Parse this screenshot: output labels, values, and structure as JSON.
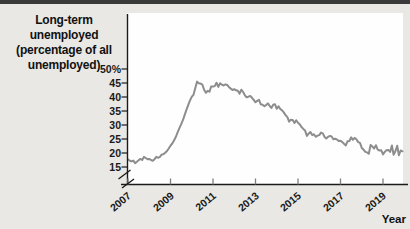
{
  "figure": {
    "title_lines": [
      "Long-term unemployed",
      "(percentage of all",
      "unemployed)"
    ],
    "x_axis_label": "Year"
  },
  "chart": {
    "y_ticks": [
      {
        "label": "50%",
        "value": 50
      },
      {
        "label": "45",
        "value": 45
      },
      {
        "label": "40",
        "value": 40
      },
      {
        "label": "35",
        "value": 35
      },
      {
        "label": "30",
        "value": 30
      },
      {
        "label": "25",
        "value": 25
      },
      {
        "label": "20",
        "value": 20
      },
      {
        "label": "15",
        "value": 15
      }
    ],
    "x_ticks": [
      {
        "label": "2007",
        "value": 2007
      },
      {
        "label": "2009",
        "value": 2009
      },
      {
        "label": "2011",
        "value": 2011
      },
      {
        "label": "2013",
        "value": 2013
      },
      {
        "label": "2015",
        "value": 2015
      },
      {
        "label": "2017",
        "value": 2017
      },
      {
        "label": "2019",
        "value": 2019
      }
    ]
  },
  "colors": {
    "page_background": "#e9e8e4",
    "plot_background": "#fefefe",
    "top_rule": "#3a3a3a",
    "axis": "#1a1a1a",
    "x_tick": "#7f7f7f",
    "data_line": "#8d8d8d",
    "text": "#111111"
  },
  "chart_data": {
    "type": "line",
    "title": "Long-term unemployed (percentage of all unemployed)",
    "xlabel": "Year",
    "ylabel": "Long-term unemployed (percentage of all unemployed)",
    "x_start_year": 2007,
    "x_end_year": 2019,
    "x_interval": "monthly",
    "x_tick_years": [
      2007,
      2009,
      2011,
      2013,
      2015,
      2017,
      2019
    ],
    "y_tick_values": [
      15,
      20,
      25,
      30,
      35,
      40,
      45,
      50
    ],
    "ylim_shown": [
      15,
      50
    ],
    "axis_break_at_origin": true,
    "grid": false,
    "legend": false,
    "series": [
      {
        "name": "Long-term unemployed (percentage of all unemployed)",
        "values": [
          17.7,
          17.2,
          17.0,
          17.3,
          16.4,
          16.9,
          17.4,
          17.9,
          17.5,
          18.6,
          18.2,
          17.8,
          17.9,
          17.5,
          17.2,
          17.8,
          18.6,
          18.3,
          18.6,
          19.4,
          19.6,
          20.1,
          20.7,
          21.6,
          22.6,
          23.4,
          24.5,
          25.7,
          27.4,
          28.9,
          30.2,
          31.7,
          33.6,
          35.4,
          37.1,
          38.8,
          40.1,
          40.8,
          43.2,
          45.5,
          44.9,
          44.8,
          44.4,
          42.6,
          41.5,
          42.2,
          41.9,
          43.8,
          43.7,
          43.9,
          45.1,
          43.6,
          44.9,
          44.4,
          44.1,
          44.5,
          44.3,
          43.6,
          43.0,
          42.5,
          42.8,
          42.4,
          42.2,
          41.2,
          42.6,
          41.8,
          40.6,
          39.9,
          40.1,
          40.4,
          39.7,
          39.0,
          38.1,
          38.6,
          39.0,
          37.4,
          37.2,
          36.7,
          37.1,
          37.7,
          36.8,
          36.1,
          37.2,
          37.4,
          35.8,
          36.7,
          35.7,
          35.2,
          34.5,
          33.5,
          32.8,
          31.2,
          31.9,
          31.8,
          30.7,
          31.7,
          30.8,
          30.2,
          29.3,
          28.6,
          28.0,
          26.1,
          26.9,
          27.5,
          26.4,
          26.7,
          25.8,
          26.2,
          26.4,
          27.3,
          27.0,
          25.7,
          25.2,
          25.8,
          26.1,
          25.9,
          24.9,
          25.1,
          24.8,
          24.3,
          24.4,
          23.9,
          23.3,
          22.7,
          24.2,
          24.3,
          25.6,
          24.7,
          25.4,
          24.9,
          23.9,
          23.6,
          21.8,
          21.2,
          20.4,
          20.2,
          19.7,
          22.9,
          22.3,
          21.6,
          22.8,
          21.2,
          20.9,
          21.0,
          19.5,
          20.4,
          21.0,
          21.1,
          20.4,
          22.7,
          19.4,
          20.6,
          22.6,
          19.2,
          20.9,
          20.6
        ]
      }
    ]
  }
}
